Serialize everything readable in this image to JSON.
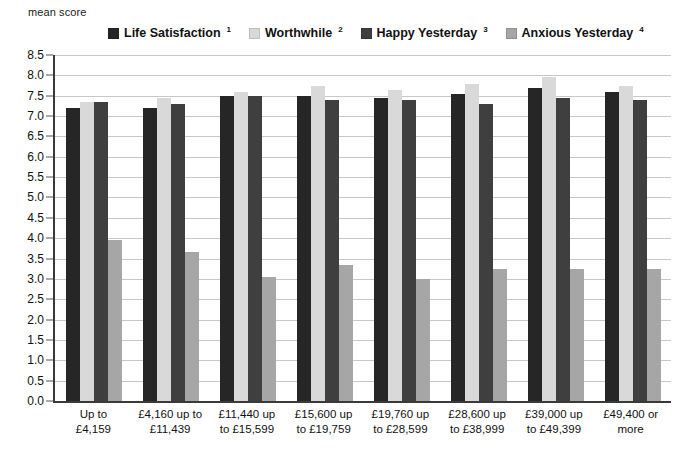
{
  "chart_data": {
    "type": "bar",
    "title": "",
    "subtitle": "",
    "ylabel": "mean score",
    "xlabel": "",
    "ylim": [
      0.0,
      8.5
    ],
    "ytick_step": 0.5,
    "grid": true,
    "legend_position": "top",
    "categories": [
      [
        "Up to",
        "£4,159"
      ],
      [
        "£4,160 up to",
        "£11,439"
      ],
      [
        "£11,440 up",
        "to £15,599"
      ],
      [
        "£15,600 up",
        "to £19,759"
      ],
      [
        "£19,760 up",
        "to £28,599"
      ],
      [
        "£28,600 up",
        "to £38,999"
      ],
      [
        "£39,000 up",
        "to £49,399"
      ],
      [
        "£49,400 or",
        "more"
      ]
    ],
    "ytick_labels": [
      "8.5",
      "8.0",
      "7.5",
      "7.0",
      "6.5",
      "6.0",
      "5.5",
      "5.0",
      "4.5",
      "4.0",
      "3.5",
      "3.0",
      "2.5",
      "2.0",
      "1.5",
      "1.0",
      "0.5",
      "0.0"
    ],
    "series": [
      {
        "name": "Life Satisfaction",
        "footnote": "1",
        "color": "#262626",
        "values": [
          7.2,
          7.2,
          7.5,
          7.5,
          7.45,
          7.55,
          7.7,
          7.6
        ]
      },
      {
        "name": "Worthwhile",
        "footnote": "2",
        "color": "#d9d9d9",
        "values": [
          7.35,
          7.45,
          7.6,
          7.75,
          7.65,
          7.8,
          7.95,
          7.75
        ]
      },
      {
        "name": "Happy Yesterday",
        "footnote": "3",
        "color": "#3f3f3f",
        "values": [
          7.35,
          7.3,
          7.5,
          7.4,
          7.4,
          7.3,
          7.45,
          7.4
        ]
      },
      {
        "name": "Anxious Yesterday",
        "footnote": "4",
        "color": "#a6a6a6",
        "values": [
          3.95,
          3.65,
          3.05,
          3.35,
          3.0,
          3.25,
          3.25,
          3.25
        ]
      }
    ]
  }
}
